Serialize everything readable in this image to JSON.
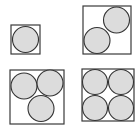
{
  "diagram": {
    "colors": {
      "background": "#ffffff",
      "square_stroke": "#3a3a3a",
      "circle_fill": "#dcdcdc",
      "circle_stroke": "#333333"
    },
    "panels": [
      {
        "name": "n1",
        "count": 1,
        "square": {
          "x": 11,
          "y": 25,
          "size": 29
        },
        "circles": [
          {
            "cx": 25.5,
            "cy": 39.5,
            "r": 13
          }
        ]
      },
      {
        "name": "n2",
        "count": 2,
        "square": {
          "x": 83,
          "y": 6,
          "size": 48
        },
        "circles": [
          {
            "cx": 116.5,
            "cy": 20,
            "r": 13
          },
          {
            "cx": 97,
            "cy": 40.5,
            "r": 13
          }
        ]
      },
      {
        "name": "n3",
        "count": 3,
        "square": {
          "x": 10,
          "y": 70,
          "size": 54
        },
        "circles": [
          {
            "cx": 24,
            "cy": 86,
            "r": 13
          },
          {
            "cx": 50,
            "cy": 83,
            "r": 13
          },
          {
            "cx": 41,
            "cy": 108.5,
            "r": 13
          }
        ]
      },
      {
        "name": "n4",
        "count": 4,
        "square": {
          "x": 82,
          "y": 69,
          "size": 52
        },
        "circles": [
          {
            "cx": 95,
            "cy": 82,
            "r": 12.5
          },
          {
            "cx": 121,
            "cy": 82,
            "r": 12.5
          },
          {
            "cx": 95,
            "cy": 108,
            "r": 12.5
          },
          {
            "cx": 121,
            "cy": 108,
            "r": 12.5
          }
        ]
      }
    ]
  }
}
